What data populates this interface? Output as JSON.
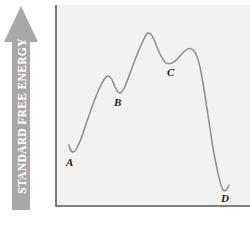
{
  "figure": {
    "background_color": "#ffffff",
    "plot_background_color": "#f2f2f0",
    "axis_color": "#5a5a5a",
    "curve_color": "#8c8c8c",
    "arrow_color": "#a8a8a8"
  },
  "y_axis": {
    "label": "STANDARD FREE ENERGY",
    "label_color": "#ffffff",
    "arrow_direction": "up",
    "arrow_icon": "up-arrow-icon"
  },
  "chart_data": {
    "type": "line",
    "title": "",
    "xlabel": "",
    "ylabel": "STANDARD FREE ENERGY",
    "xlim": [
      0,
      195
    ],
    "ylim": [
      0,
      202
    ],
    "grid": false,
    "legend": "none",
    "y_axis_direction": "increasing-upward",
    "annotations": [
      {
        "label": "A",
        "x": 17,
        "y": 147,
        "role": "local-minimum"
      },
      {
        "label": "B",
        "x": 64,
        "y": 87,
        "role": "local-minimum"
      },
      {
        "label": "C",
        "x": 117,
        "y": 58,
        "role": "local-minimum"
      },
      {
        "label": "D",
        "x": 170,
        "y": 185,
        "role": "global-minimum"
      }
    ],
    "extrema": {
      "minima": [
        {
          "label": "A",
          "x": 17,
          "y": 147
        },
        {
          "label": "B",
          "x": 64,
          "y": 87
        },
        {
          "label": "C",
          "x": 117,
          "y": 58
        },
        {
          "label": "D",
          "x": 170,
          "y": 185
        }
      ],
      "maxima": [
        {
          "label": "",
          "x": 52,
          "y": 72
        },
        {
          "label": "",
          "x": 93,
          "y": 28
        },
        {
          "label": "",
          "x": 137,
          "y": 45
        }
      ]
    },
    "x": [
      14,
      17,
      22,
      30,
      40,
      52,
      58,
      64,
      70,
      80,
      93,
      104,
      117,
      126,
      137,
      147,
      155,
      163,
      170,
      176
    ],
    "y": [
      140,
      147,
      143,
      122,
      98,
      72,
      74,
      87,
      80,
      58,
      28,
      40,
      58,
      50,
      45,
      62,
      110,
      165,
      185,
      178
    ]
  },
  "curve_path": "M 14,140 C 15,145 16,147 18,147 C 21,147 24,140 28,128 C 34,110 40,92 46,80 C 49,74 51,71 53,71 C 56,71 58,76 60,82 C 62,86 63,88 65,88 C 67,88 69,84 71,79 C 76,66 82,48 88,36 C 90,31 92,28 94,28 C 96,28 98,32 100,37 C 103,45 106,53 110,57 C 113,60 116,59 119,57 C 123,54 127,48 131,45 C 134,43 136,43 138,45 C 141,47 143,53 145,62 C 149,80 153,112 158,143 C 162,165 165,180 168,185 C 170,187 172,185 174,180"
}
